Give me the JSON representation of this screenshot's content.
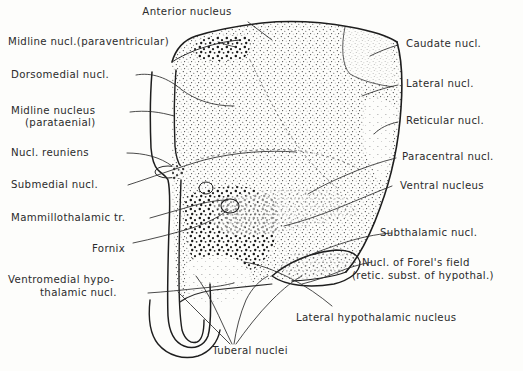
{
  "figure": {
    "type": "anatomical-diagram",
    "ink_color": "#2b2b2b",
    "background_color": "#fdfdfb"
  },
  "labels": {
    "anterior_nucleus": "Anterior nucleus",
    "midline_paraventricular": "Midline nucl.(paraventricular)",
    "dorsomedial": "Dorsomedial nucl.",
    "midline_nucleus": "Midline nucleus",
    "parataenial": "(parataenial)",
    "nucl_reuniens": "Nucl. reuniens",
    "submedial": "Submedial nucl.",
    "mammillothalamic": "Mammillothalamic tr.",
    "fornix": "Fornix",
    "ventromedial_1": "Ventromedial hypo-",
    "ventromedial_2": "thalamic nucl.",
    "caudate": "Caudate nucl.",
    "lateral": "Lateral nucl.",
    "reticular": "Reticular nucl.",
    "paracentral": "Paracentral nucl.",
    "ventral": "Ventral nucleus",
    "subthalamic": "Subthalamic nucl.",
    "forel_1": "Nucl. of Forel's field",
    "forel_2": "(retic. subst. of hypothal.)",
    "lateral_hypothalamic": "Lateral hypothalamic nucleus",
    "tuberal": "Tuberal nuclei"
  }
}
